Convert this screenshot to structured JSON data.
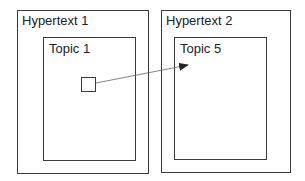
{
  "hypertexts": [
    {
      "label": "Hypertext 1",
      "topic": {
        "label": "Topic 1"
      }
    },
    {
      "label": "Hypertext 2",
      "topic": {
        "label": "Topic 5"
      }
    }
  ],
  "link": {
    "from": "Topic 1 anchor",
    "to": "Topic 5"
  },
  "colors": {
    "stroke": "#3a3a3a",
    "arrow": "#555555"
  }
}
